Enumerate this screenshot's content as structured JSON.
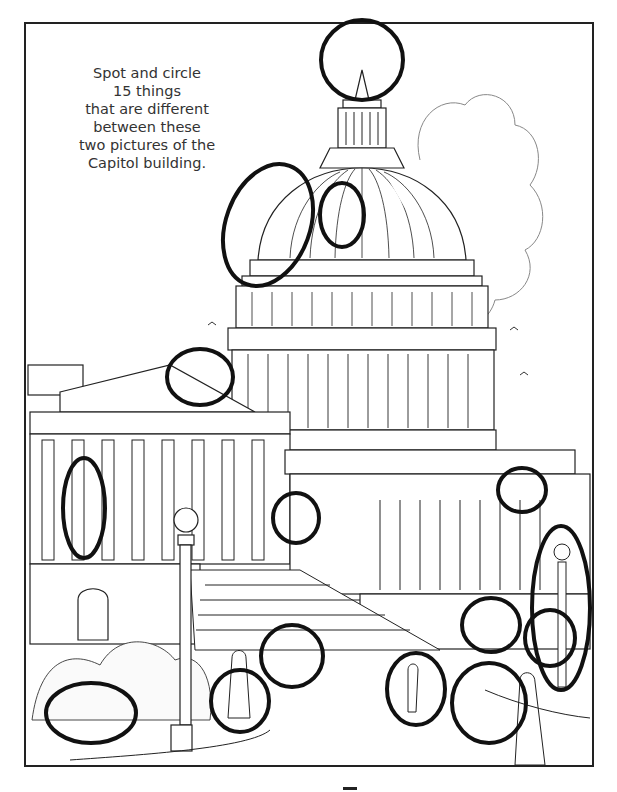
{
  "puzzle": {
    "instructions_lines": [
      "Spot and circle",
      "15 things",
      "that are different",
      "between these",
      "two pictures of the",
      "Capitol building."
    ],
    "subject": "Capitol building",
    "difference_count": 15,
    "circles_drawn": 16
  },
  "colors": {
    "ink": "#222222",
    "circle_ink": "#111111",
    "text": "#333333",
    "background": "#ffffff"
  },
  "circles": [
    {
      "name": "circle-dome-top",
      "cx": 362,
      "cy": 60,
      "rx": 41,
      "ry": 40
    },
    {
      "name": "circle-dome-left",
      "cx": 268,
      "cy": 225,
      "rx": 42,
      "ry": 63
    },
    {
      "name": "circle-dome-window",
      "cx": 342,
      "cy": 215,
      "rx": 22,
      "ry": 32
    },
    {
      "name": "circle-pediment",
      "cx": 200,
      "cy": 377,
      "rx": 33,
      "ry": 28
    },
    {
      "name": "circle-left-doors",
      "cx": 84,
      "cy": 508,
      "rx": 21,
      "ry": 50
    },
    {
      "name": "circle-center-arch",
      "cx": 296,
      "cy": 518,
      "rx": 23,
      "ry": 25
    },
    {
      "name": "circle-right-pediment",
      "cx": 522,
      "cy": 490,
      "rx": 24,
      "ry": 22
    },
    {
      "name": "circle-right-lamp",
      "cx": 561,
      "cy": 608,
      "rx": 29,
      "ry": 82
    },
    {
      "name": "circle-wall-stones",
      "cx": 491,
      "cy": 625,
      "rx": 29,
      "ry": 27
    },
    {
      "name": "circle-right-door",
      "cx": 550,
      "cy": 638,
      "rx": 25,
      "ry": 28
    },
    {
      "name": "circle-steps",
      "cx": 292,
      "cy": 656,
      "rx": 31,
      "ry": 31
    },
    {
      "name": "circle-walking-person",
      "cx": 416,
      "cy": 689,
      "rx": 29,
      "ry": 36
    },
    {
      "name": "circle-tourist-photo",
      "cx": 489,
      "cy": 703,
      "rx": 37,
      "ry": 40
    },
    {
      "name": "circle-woman-skirt",
      "cx": 240,
      "cy": 701,
      "rx": 29,
      "ry": 31
    },
    {
      "name": "circle-bush-animal",
      "cx": 91,
      "cy": 713,
      "rx": 45,
      "ry": 30
    }
  ]
}
